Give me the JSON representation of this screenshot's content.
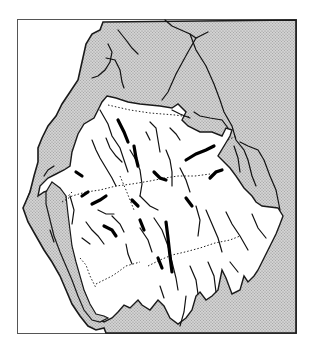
{
  "map": {
    "type": "schematic drainage map",
    "frame": {
      "x": 17,
      "y": 19,
      "width": 280,
      "height": 315
    },
    "colors": {
      "background": "#ffffff",
      "lowland_fill": "#c8c8c8",
      "upland_fill": "#ffffff",
      "stroke": "#1a1a1a",
      "frame": "#555555"
    },
    "legend_items": [
      {
        "name": "lowland-area",
        "style": "stippled grey"
      },
      {
        "name": "upland-area",
        "style": "white"
      },
      {
        "name": "rivers",
        "style": "solid black line"
      },
      {
        "name": "lakes",
        "style": "thick black line"
      },
      {
        "name": "boundary",
        "style": "dotted line"
      }
    ]
  }
}
